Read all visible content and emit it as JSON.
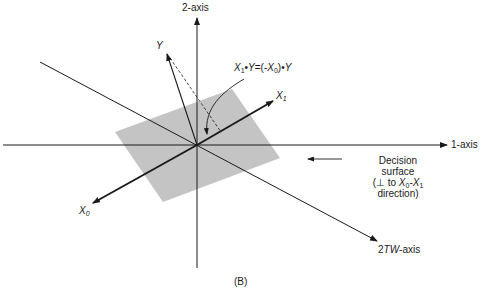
{
  "figure": {
    "caption": "(B)",
    "axes": {
      "axis1_label": "1-axis",
      "axis2_label": "2-axis",
      "axis_2tw_prefix": "2",
      "axis_2tw_italic": "TW",
      "axis_2tw_suffix": "-axis"
    },
    "vectors": {
      "y_label": "Y",
      "x1_label": "X",
      "x1_sub": "1",
      "x0_label": "X",
      "x0_sub": "0"
    },
    "equation": {
      "x1": "X",
      "x1_sub": "1",
      "dot1": "•",
      "y1": "Y",
      "eq": "=(-",
      "x0": "X",
      "x0_sub": "0",
      "close": ")",
      "dot2": "•",
      "y2": "Y"
    },
    "decision_surface": {
      "line1": "Decision",
      "line2": "surface",
      "line3_prefix": "(⊥ to ",
      "line3_x0": "X",
      "line3_x0_sub": "0",
      "line3_dash": "-",
      "line3_x1": "X",
      "line3_x1_sub": "1",
      "line4": "direction)"
    },
    "colors": {
      "ink": "#1a1a1a",
      "surface": "#c4c4c4",
      "background": "#ffffff"
    }
  }
}
